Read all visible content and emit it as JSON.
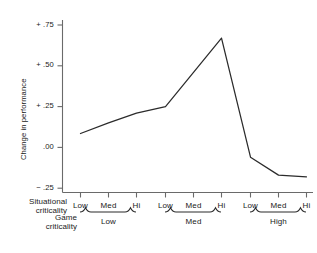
{
  "chart_data": {
    "type": "line",
    "title": "",
    "xlabel": "",
    "ylabel": "Change in performance",
    "ylim": [
      -0.25,
      0.8
    ],
    "yticks": [
      0.75,
      0.5,
      0.25,
      0.0,
      -0.25
    ],
    "ytick_labels": [
      "+ .75",
      "+ .50",
      "+ .25",
      ".00",
      "− .25"
    ],
    "grid": false,
    "legend": false,
    "categories": [
      "Low",
      "Med",
      "Hi",
      "Low",
      "Med",
      "Hi",
      "Low",
      "Med",
      "Hi"
    ],
    "values": [
      0.085,
      0.15,
      0.21,
      0.25,
      0.46,
      0.67,
      -0.06,
      -0.17,
      -0.18
    ],
    "series": [
      {
        "name": "Change in performance",
        "values": [
          0.085,
          0.15,
          0.21,
          0.25,
          0.46,
          0.67,
          -0.06,
          -0.17,
          -0.18
        ]
      }
    ],
    "axis_rows": [
      {
        "title_line1": "Situational",
        "title_line2": "criticality",
        "ticks": [
          "Low",
          "Med",
          "Hi",
          "Low",
          "Med",
          "Hi",
          "Low",
          "Med",
          "Hi"
        ]
      },
      {
        "title_line1": "Game",
        "title_line2": "criticality",
        "groups": [
          "Low",
          "Med",
          "High"
        ]
      }
    ],
    "line_color": "#2b2b2b",
    "axis_color": "#5a5a5a"
  },
  "axes": {
    "y_axis_title": "Change in performance",
    "y_tick_labels": [
      "+ .75",
      "+ .50",
      "+ .25",
      ".00",
      "− .25"
    ]
  },
  "x_axis": {
    "situational_title_line1": "Situational",
    "situational_title_line2": "criticality",
    "situational_ticks": [
      "Low",
      "Med",
      "Hi",
      "Low",
      "Med",
      "Hi",
      "Low",
      "Med",
      "Hi"
    ],
    "game_title_line1": "Game",
    "game_title_line2": "criticality",
    "game_groups": [
      "Low",
      "Med",
      "High"
    ]
  }
}
